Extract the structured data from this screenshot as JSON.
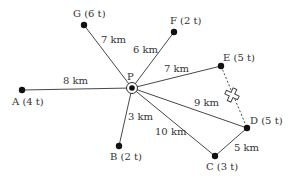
{
  "diagram": {
    "hub": {
      "id": "P",
      "label": "P",
      "x": 132,
      "y": 88,
      "label_x": 127,
      "label_y": 80
    },
    "nodes": [
      {
        "id": "G",
        "label": "G (6 t)",
        "x": 84,
        "y": 25,
        "label_x": 73,
        "label_y": 17
      },
      {
        "id": "F",
        "label": "F (2 t)",
        "x": 174,
        "y": 32,
        "label_x": 170,
        "label_y": 24
      },
      {
        "id": "E",
        "label": "E (5 t)",
        "x": 221,
        "y": 66,
        "label_x": 223,
        "label_y": 61
      },
      {
        "id": "D",
        "label": "D (5 t)",
        "x": 247,
        "y": 128,
        "label_x": 250,
        "label_y": 124
      },
      {
        "id": "C",
        "label": "C (3 t)",
        "x": 215,
        "y": 156,
        "label_x": 206,
        "label_y": 170
      },
      {
        "id": "B",
        "label": "B (2 t)",
        "x": 119,
        "y": 146,
        "label_x": 110,
        "label_y": 160
      },
      {
        "id": "A",
        "label": "A (4 t)",
        "x": 22,
        "y": 90,
        "label_x": 12,
        "label_y": 105
      }
    ],
    "edges": [
      {
        "from": "P",
        "to": "G",
        "label": "7 km",
        "label_x": 101,
        "label_y": 43,
        "style": "solid"
      },
      {
        "from": "P",
        "to": "F",
        "label": "6 km",
        "label_x": 133,
        "label_y": 53,
        "style": "solid"
      },
      {
        "from": "P",
        "to": "E",
        "label": "7 km",
        "label_x": 164,
        "label_y": 72,
        "style": "solid"
      },
      {
        "from": "P",
        "to": "D",
        "label": "9 km",
        "label_x": 194,
        "label_y": 106,
        "style": "solid"
      },
      {
        "from": "P",
        "to": "C",
        "label": "10 km",
        "label_x": 155,
        "label_y": 135,
        "style": "solid"
      },
      {
        "from": "P",
        "to": "B",
        "label": "3 km",
        "label_x": 128,
        "label_y": 120,
        "style": "solid"
      },
      {
        "from": "P",
        "to": "A",
        "label": "8 km",
        "label_x": 63,
        "label_y": 84,
        "style": "solid"
      },
      {
        "from": "C",
        "to": "D",
        "label": "5 km",
        "label_x": 234,
        "label_y": 151,
        "style": "solid"
      },
      {
        "from": "E",
        "to": "D",
        "label": "",
        "label_x": 0,
        "label_y": 0,
        "style": "dashed"
      }
    ],
    "break_marker": {
      "x": 232,
      "y": 95,
      "label": "blocked"
    },
    "colors": {
      "line": "#333333",
      "node": "#111111",
      "text": "#333333"
    }
  }
}
